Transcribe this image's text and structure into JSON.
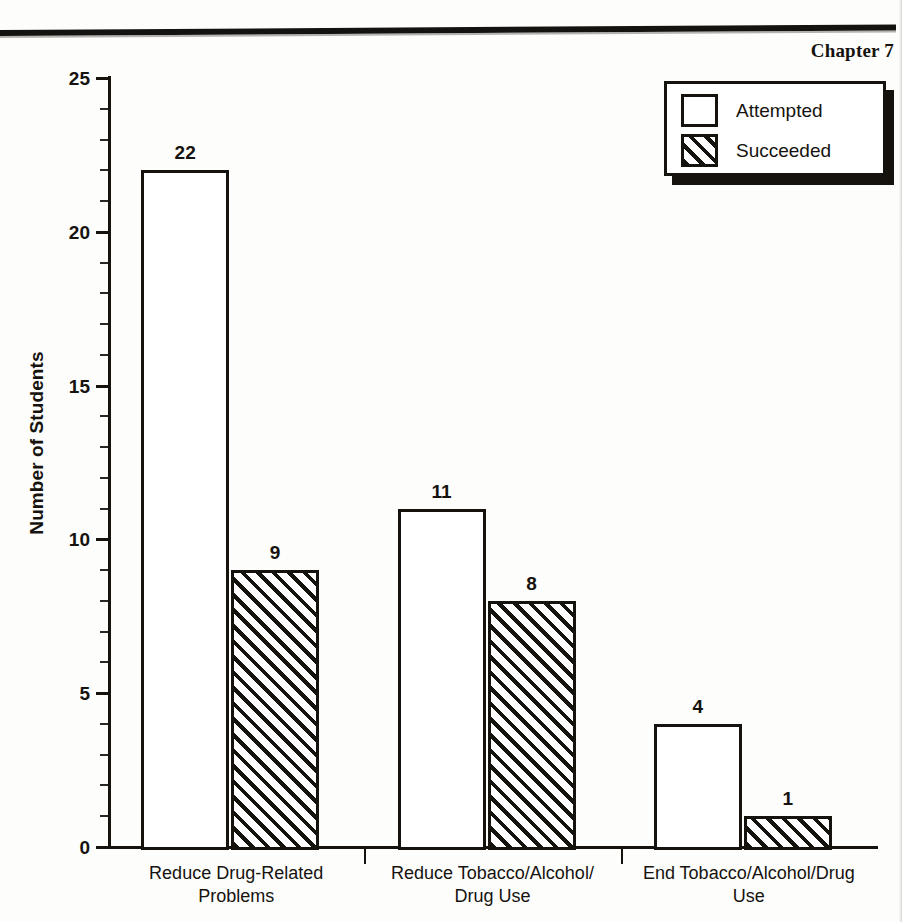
{
  "page": {
    "chapter_label": "Chapter 7"
  },
  "chart_data": {
    "type": "bar",
    "title": "",
    "xlabel": "",
    "ylabel": "Number of Students",
    "ylim": [
      0,
      25
    ],
    "ytick_labels": [
      "0",
      "5",
      "10",
      "15",
      "20",
      "25"
    ],
    "ytick_values": [
      0,
      5,
      10,
      15,
      20,
      25
    ],
    "minor_tick_step": 1,
    "grid": false,
    "legend_position": "top-right",
    "categories": [
      "Reduce Drug-Related\nProblems",
      "Reduce Tobacco/Alcohol/\nDrug Use",
      "End Tobacco/Alcohol/Drug\nUse"
    ],
    "category_lines": [
      [
        "Reduce Drug-Related",
        "Problems"
      ],
      [
        "Reduce Tobacco/Alcohol/",
        "Drug Use"
      ],
      [
        "End Tobacco/Alcohol/Drug",
        "Use"
      ]
    ],
    "series": [
      {
        "name": "Attempted",
        "fill": "white",
        "values": [
          22,
          11,
          4
        ]
      },
      {
        "name": "Succeeded",
        "fill": "hatched",
        "values": [
          9,
          8,
          1
        ]
      }
    ],
    "data_labels": [
      "22",
      "9",
      "11",
      "8",
      "4",
      "1"
    ],
    "colors": {
      "ink": "#16130f",
      "paper": "#ffffff"
    }
  },
  "legend": {
    "items": [
      {
        "label": "Attempted",
        "swatch": "white-square"
      },
      {
        "label": "Succeeded",
        "swatch": "hatched-square"
      }
    ]
  }
}
